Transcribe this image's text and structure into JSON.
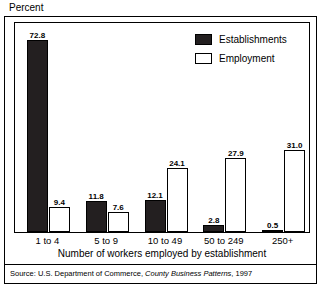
{
  "figure": {
    "y_axis_title": "Percent",
    "x_axis_title": "Number of workers employed by establishment",
    "source_prefix": "Source: U.S. Department of Commerce, ",
    "source_italic": "County Business Patterns",
    "source_suffix": ", 1997"
  },
  "legend": {
    "items": [
      {
        "label": "Establishments",
        "swatch": "filled",
        "color": "#231f20"
      },
      {
        "label": "Employment",
        "swatch": "hollow",
        "color": "#ffffff"
      }
    ]
  },
  "chart_data": {
    "type": "bar",
    "title": "",
    "xlabel": "Number of workers employed by establishment",
    "ylabel": "Percent",
    "ylim": [
      0,
      80
    ],
    "grid": false,
    "legend_position": "top-right inside plot",
    "categories": [
      "1 to 4",
      "5 to 9",
      "10 to 49",
      "50 to 249",
      "250+"
    ],
    "series": [
      {
        "name": "Establishments",
        "color": "#231f20",
        "values": [
          72.8,
          11.8,
          12.1,
          2.8,
          0.5
        ],
        "labels": [
          "72.8",
          "11.8",
          "12.1",
          "2.8",
          "0.5"
        ]
      },
      {
        "name": "Employment",
        "color": "#ffffff",
        "values": [
          9.4,
          7.6,
          24.1,
          27.9,
          31.0
        ],
        "labels": [
          "9.4",
          "7.6",
          "24.1",
          "27.9",
          "31.0"
        ]
      }
    ]
  }
}
